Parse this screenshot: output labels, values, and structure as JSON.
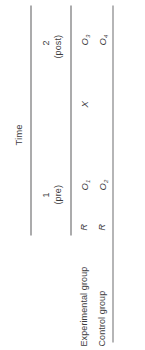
{
  "figure": {
    "type": "research-design-notation-table",
    "orientation": "rotated-90-ccw",
    "spanner_label": "Time",
    "rule_color": "#59595b",
    "text_color": "#3c3c3e",
    "background": "#ffffff"
  },
  "columns": {
    "row_label_header": "",
    "assignment_header": "",
    "time1": {
      "number": "1",
      "qualifier": "(pre)"
    },
    "treatment": {
      "label": ""
    },
    "time2": {
      "number": "2",
      "qualifier": "(post)"
    }
  },
  "rows": [
    {
      "label": "Experimental group",
      "assignment": "R",
      "pre_observation": "O",
      "pre_observation_sub": "1",
      "treatment": "X",
      "post_observation": "O",
      "post_observation_sub": "3"
    },
    {
      "label": "Control group",
      "assignment": "R",
      "pre_observation": "O",
      "pre_observation_sub": "2",
      "treatment": "",
      "post_observation": "O",
      "post_observation_sub": "4"
    }
  ]
}
